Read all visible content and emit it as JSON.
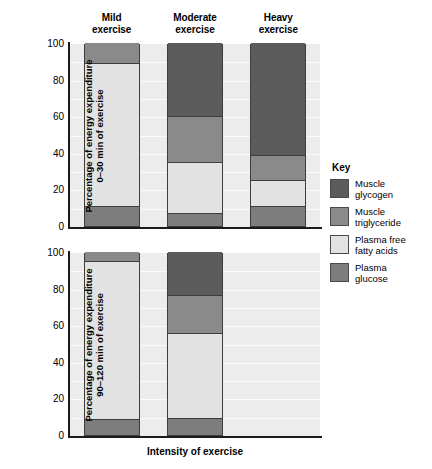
{
  "chart_data": {
    "type": "bar",
    "subtype": "stacked-bar",
    "title": "",
    "xlabel": "Intensity of exercise",
    "categories": [
      "Mild exercise",
      "Moderate exercise",
      "Heavy exercise"
    ],
    "ylim": [
      0,
      100
    ],
    "yticks": [
      0,
      20,
      40,
      60,
      80,
      100
    ],
    "grid": true,
    "legend_position": "right",
    "legend_title": "Key",
    "series_names": [
      "Muscle glycogen",
      "Muscle triglyceride",
      "Plasma free fatty acids",
      "Plasma glucose"
    ],
    "panels": [
      {
        "id": "panel-top",
        "ylabel": "Percentage of energy expenditure 0–30 min of exercise",
        "ylabel_lines": [
          "Percentage of energy expenditure",
          "0–30 min of exercise"
        ],
        "series": [
          {
            "name": "Muscle glycogen",
            "values": [
              0,
              40,
              61
            ]
          },
          {
            "name": "Muscle triglyceride",
            "values": [
              11,
              25,
              14
            ]
          },
          {
            "name": "Plasma free fatty acids",
            "values": [
              78,
              28,
              14
            ]
          },
          {
            "name": "Plasma glucose",
            "values": [
              11,
              7,
              11
            ]
          }
        ],
        "boundaries": [
          {
            "category": "Mild exercise",
            "glucose_top": 11,
            "ffa_top": 89,
            "triglyceride_top": 100,
            "glycogen_top": 100
          },
          {
            "category": "Moderate exercise",
            "glucose_top": 7,
            "ffa_top": 35,
            "triglyceride_top": 60,
            "glycogen_top": 100
          },
          {
            "category": "Heavy exercise",
            "glucose_top": 11,
            "ffa_top": 25,
            "triglyceride_top": 39,
            "glycogen_top": 100
          }
        ]
      },
      {
        "id": "panel-bot",
        "ylabel": "Percentage of energy expenditure 90–120 min of exercise",
        "ylabel_lines": [
          "Percentage of energy expenditure",
          "90–120 min of exercise"
        ],
        "series": [
          {
            "name": "Muscle glycogen",
            "values": [
              0,
              23.5,
              null
            ]
          },
          {
            "name": "Muscle triglyceride",
            "values": [
              5,
              20.5,
              null
            ]
          },
          {
            "name": "Plasma free fatty acids",
            "values": [
              86,
              46.5,
              null
            ]
          },
          {
            "name": "Plasma glucose",
            "values": [
              9,
              9.5,
              null
            ]
          }
        ],
        "boundaries": [
          {
            "category": "Mild exercise",
            "glucose_top": 9,
            "ffa_top": 95,
            "triglyceride_top": 100,
            "glycogen_top": 100
          },
          {
            "category": "Moderate exercise",
            "glucose_top": 9.5,
            "ffa_top": 56,
            "triglyceride_top": 76.5,
            "glycogen_top": 100
          },
          {
            "category": "Heavy exercise",
            "glucose_top": null,
            "ffa_top": null,
            "triglyceride_top": null,
            "glycogen_top": null
          }
        ]
      }
    ]
  },
  "headers": [
    {
      "line1": "Mild",
      "line2": "exercise"
    },
    {
      "line1": "Moderate",
      "line2": "exercise"
    },
    {
      "line1": "Heavy",
      "line2": "exercise"
    }
  ],
  "axes": {
    "top": {
      "ylabel_line1": "Percentage of energy expenditure",
      "ylabel_line2": "0–30 min of exercise",
      "ticks": [
        "100",
        "80",
        "60",
        "40",
        "20",
        "0"
      ]
    },
    "bottom": {
      "ylabel_line1": "Percentage of energy expenditure",
      "ylabel_line2": "90–120 min of exercise",
      "ticks": [
        "100",
        "80",
        "60",
        "40",
        "20",
        "0"
      ]
    },
    "xlabel": "Intensity of exercise"
  },
  "legend": {
    "title": "Key",
    "items": [
      {
        "line1": "Muscle",
        "line2": "glycogen",
        "color": "#5c5c5c"
      },
      {
        "line1": "Muscle",
        "line2": "triglyceride",
        "color": "#8a8a8a"
      },
      {
        "line1": "Plasma free",
        "line2": "fatty acids",
        "color": "#e2e2e2"
      },
      {
        "line1": "Plasma",
        "line2": "glucose",
        "color": "#7d7d7d"
      }
    ]
  },
  "colors": {
    "glycogen": "#5c5c5c",
    "triglyceride": "#8a8a8a",
    "ffa": "#e2e2e2",
    "glucose": "#7d7d7d",
    "plot_background": "#ececec",
    "gridline": "#fbfbfb",
    "axis": "#1a1a1a",
    "bar_outline": "#3d3d3d"
  }
}
